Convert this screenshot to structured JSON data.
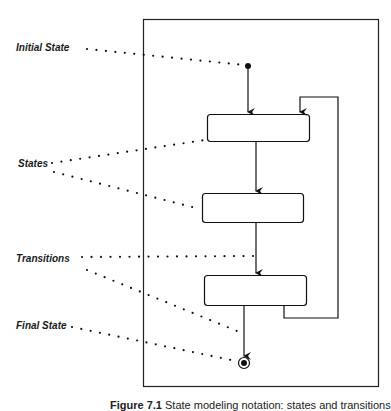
{
  "diagram": {
    "type": "state-diagram",
    "annotations": [
      {
        "id": "initial-state",
        "label": "Initial State"
      },
      {
        "id": "states",
        "label": "States"
      },
      {
        "id": "transitions",
        "label": "Transitions"
      },
      {
        "id": "final-state",
        "label": "Final State"
      }
    ],
    "nodes": [
      {
        "id": "initial",
        "kind": "initial-pseudostate"
      },
      {
        "id": "state-1",
        "kind": "state",
        "label": ""
      },
      {
        "id": "state-2",
        "kind": "state",
        "label": ""
      },
      {
        "id": "state-3",
        "kind": "state",
        "label": ""
      },
      {
        "id": "final",
        "kind": "final-state"
      }
    ],
    "edges": [
      {
        "from": "initial",
        "to": "state-1"
      },
      {
        "from": "state-1",
        "to": "state-2"
      },
      {
        "from": "state-2",
        "to": "state-3"
      },
      {
        "from": "state-3",
        "to": "state-1",
        "note": "loop back"
      },
      {
        "from": "state-3",
        "to": "final"
      }
    ],
    "caption_prefix": "Figure 7.1",
    "caption_text": "State modeling notation: states and transitions"
  }
}
